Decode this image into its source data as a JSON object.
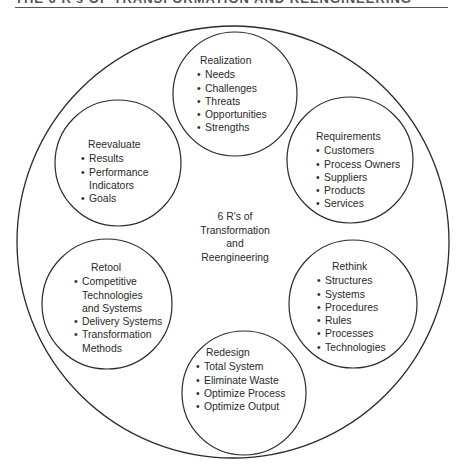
{
  "header": {
    "title": "THE 6 R's OF TRANSFORMATION AND REENGINEERING"
  },
  "diagram": {
    "center_label": [
      "6 R's of",
      "Transformation",
      "and",
      "Reengineering"
    ],
    "nodes": [
      {
        "title": "Realization",
        "items": [
          "Needs",
          "Challenges",
          "Threats",
          "Opportunities",
          "Strengths"
        ]
      },
      {
        "title": "Requirements",
        "items": [
          "Customers",
          "Process Owners",
          "Suppliers",
          "Products",
          "Services"
        ]
      },
      {
        "title": "Rethink",
        "items": [
          "Structures",
          "Systems",
          "Procedures",
          "Rules",
          "Processes",
          "Technologies"
        ]
      },
      {
        "title": "Redesign",
        "items": [
          "Total System",
          "Eliminate Waste",
          "Optimize Process",
          "Optimize Output"
        ]
      },
      {
        "title": "Retool",
        "items": [
          "Competitive Technologies and Systems",
          "Delivery Systems",
          "Transformation Methods"
        ]
      },
      {
        "title": "Reevaluate",
        "items": [
          "Results",
          "Performance Indicators",
          "Goals"
        ]
      }
    ]
  },
  "colors": {
    "stroke": "#2a2a2a",
    "text": "#2a2a2a",
    "background": "#ffffff"
  }
}
